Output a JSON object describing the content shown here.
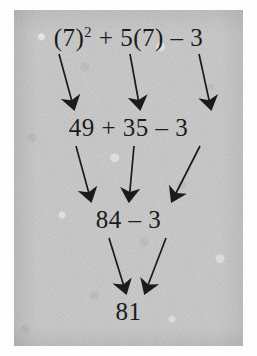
{
  "document": {
    "kind": "scanned-math-worksheet-figure",
    "background_color": "#c9c9c9",
    "ink_color": "#1b1b1b",
    "page_color": "#fdfdfd"
  },
  "expression": {
    "original": "(7)² + 5(7) – 3",
    "result": "81"
  },
  "rows": [
    {
      "id": "row-expression",
      "label": "original expression",
      "tokens": [
        {
          "kind": "term",
          "text": "(7)",
          "exponent": "2"
        },
        {
          "kind": "operator",
          "text": "+"
        },
        {
          "kind": "term",
          "text": "5(7)"
        },
        {
          "kind": "operator",
          "text": "–"
        },
        {
          "kind": "term",
          "text": "3"
        }
      ],
      "plain": "(7)2 + 5(7) – 3"
    },
    {
      "id": "row-step-1",
      "label": "after evaluating powers and products",
      "tokens": [
        {
          "kind": "term",
          "text": "49"
        },
        {
          "kind": "operator",
          "text": "+"
        },
        {
          "kind": "term",
          "text": "35"
        },
        {
          "kind": "operator",
          "text": "–"
        },
        {
          "kind": "term",
          "text": "3"
        }
      ],
      "plain": "49 + 35 – 3"
    },
    {
      "id": "row-step-2",
      "label": "after addition",
      "tokens": [
        {
          "kind": "term",
          "text": "84"
        },
        {
          "kind": "operator",
          "text": "–"
        },
        {
          "kind": "term",
          "text": "3"
        }
      ],
      "plain": "84 – 3"
    },
    {
      "id": "row-result",
      "label": "final value",
      "tokens": [
        {
          "kind": "term",
          "text": "81"
        }
      ],
      "plain": "81"
    }
  ],
  "arrow_groups": [
    {
      "id": "arrows-expression-to-step-1",
      "from_row": "row-expression",
      "to_row": "row-step-1",
      "count": 3,
      "arrows": [
        {
          "from": "(7)²",
          "to": "49",
          "x1": 45,
          "y1": 44,
          "x2": 60,
          "y2": 99
        },
        {
          "from": "5(7)",
          "to": "35",
          "x1": 116,
          "y1": 44,
          "x2": 126,
          "y2": 99
        },
        {
          "from": "3",
          "to": "3",
          "x1": 185,
          "y1": 44,
          "x2": 197,
          "y2": 99
        }
      ]
    },
    {
      "id": "arrows-step-1-to-step-2",
      "from_row": "row-step-1",
      "to_row": "row-step-2",
      "count": 3,
      "arrows": [
        {
          "from": "49",
          "to": "84",
          "x1": 62,
          "y1": 136,
          "x2": 77,
          "y2": 191
        },
        {
          "from": "35",
          "to": "84",
          "x1": 120,
          "y1": 136,
          "x2": 115,
          "y2": 191
        },
        {
          "from": "3",
          "to": "3",
          "x1": 186,
          "y1": 136,
          "x2": 158,
          "y2": 191
        }
      ]
    },
    {
      "id": "arrows-step-2-to-result",
      "from_row": "row-step-2",
      "to_row": "row-result",
      "count": 2,
      "arrows": [
        {
          "from": "84",
          "to": "81",
          "x1": 95,
          "y1": 228,
          "x2": 112,
          "y2": 283
        },
        {
          "from": "3",
          "to": "81",
          "x1": 152,
          "y1": 228,
          "x2": 131,
          "y2": 283
        }
      ]
    }
  ]
}
